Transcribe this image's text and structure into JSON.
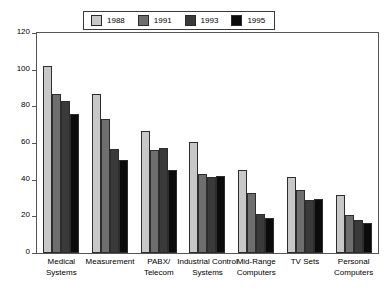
{
  "chart_data": {
    "type": "bar",
    "title": "",
    "xlabel": "",
    "ylabel": "",
    "ylim": [
      0,
      120
    ],
    "yticks": [
      0,
      20,
      40,
      60,
      80,
      100,
      120
    ],
    "grid": false,
    "legend_position": "top-center",
    "categories": [
      "Medical Systems",
      "Measurement",
      "PABX/ Telecom",
      "Industrial Control Systems",
      "Mid-Range Computers",
      "TV Sets",
      "Personal Computers"
    ],
    "category_lines": [
      [
        "Medical",
        "Systems"
      ],
      [
        "Measurement"
      ],
      [
        "PABX/",
        "Telecom"
      ],
      [
        "Industrial Control",
        "Systems"
      ],
      [
        "Mid-Range",
        "Computers"
      ],
      [
        "TV Sets"
      ],
      [
        "Personal",
        "Computers"
      ]
    ],
    "series": [
      {
        "name": "1988",
        "color": "#c8c8c8",
        "values": [
          102,
          86.5,
          66.5,
          60.5,
          45.5,
          41.5,
          31.5
        ]
      },
      {
        "name": "1991",
        "color": "#6e6e6e",
        "values": [
          87,
          73,
          56,
          43,
          32.5,
          34.5,
          21
        ]
      },
      {
        "name": "1993",
        "color": "#3a3a3a",
        "values": [
          83,
          57,
          57.5,
          41.5,
          21.5,
          29,
          18
        ]
      },
      {
        "name": "1995",
        "color": "#0b0b0b",
        "values": [
          76,
          51,
          45.5,
          42,
          19,
          29.5,
          16.5
        ]
      }
    ]
  }
}
